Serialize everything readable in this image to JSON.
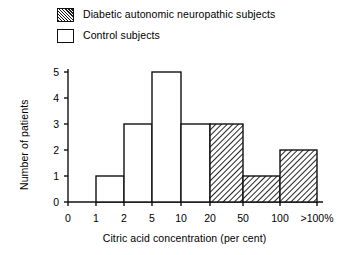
{
  "legend": {
    "items": [
      {
        "label": "Diabetic autonomic neuropathic subjects",
        "swatch": "hatched",
        "color": "#1a1a1a"
      },
      {
        "label": "Control subjects",
        "swatch": "open",
        "color": "#ffffff"
      }
    ]
  },
  "chart_data": {
    "type": "bar",
    "title": "",
    "xlabel": "Citric acid concentration (per cent)",
    "ylabel": "Number of patients",
    "categories": [
      "0-1",
      "1-2",
      "2-5",
      "5-10",
      "10-20",
      "20-50",
      "50-100",
      "100->100%"
    ],
    "xtick_labels": [
      "0",
      "1",
      "2",
      "5",
      "10",
      "20",
      "50",
      "100",
      ">100%"
    ],
    "ytick_labels": [
      "0",
      "1",
      "2",
      "3",
      "4",
      "5"
    ],
    "ylim": [
      0,
      5
    ],
    "grid": false,
    "legend_position": "top-left",
    "series": [
      {
        "name": "Control subjects",
        "fill": "open",
        "values": [
          0,
          1,
          3,
          5,
          3,
          0,
          0,
          0
        ]
      },
      {
        "name": "Diabetic autonomic neuropathic subjects",
        "fill": "hatched",
        "values": [
          0,
          0,
          0,
          0,
          0,
          3,
          1,
          2
        ]
      }
    ]
  }
}
